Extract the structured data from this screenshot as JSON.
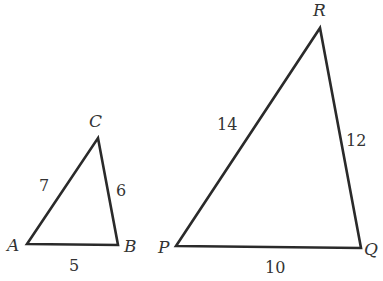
{
  "diagram": {
    "triangles": [
      {
        "name": "ABC",
        "vertices": [
          {
            "label": "A",
            "x": 27,
            "y": 244
          },
          {
            "label": "B",
            "x": 118,
            "y": 245
          },
          {
            "label": "C",
            "x": 98,
            "y": 138
          }
        ],
        "sides": [
          {
            "between": "AB",
            "label": "5"
          },
          {
            "between": "BC",
            "label": "6"
          },
          {
            "between": "AC",
            "label": "7"
          }
        ]
      },
      {
        "name": "PQR",
        "vertices": [
          {
            "label": "P",
            "x": 176,
            "y": 246
          },
          {
            "label": "Q",
            "x": 361,
            "y": 248
          },
          {
            "label": "R",
            "x": 320,
            "y": 28
          }
        ],
        "sides": [
          {
            "between": "PQ",
            "label": "10"
          },
          {
            "between": "QR",
            "label": "12"
          },
          {
            "between": "PR",
            "label": "14"
          }
        ]
      }
    ],
    "stroke_color": "#2a2a2a",
    "background": "#ffffff"
  }
}
